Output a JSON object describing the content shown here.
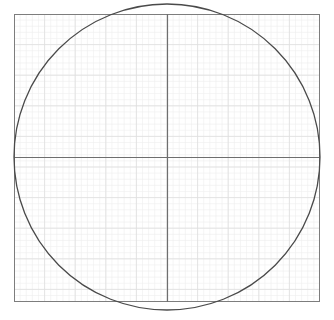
{
  "canvas": {
    "width": 334,
    "height": 320,
    "background": "#ffffff"
  },
  "chart_data": {
    "type": "scatter",
    "title": "",
    "subtitle": "",
    "xlabel": "",
    "ylabel": "",
    "grid": true,
    "legend_position": "none",
    "plot_frame": {
      "left": 14,
      "top": 14,
      "right": 320,
      "bottom": 302,
      "width": 306,
      "height": 288,
      "border_color": "#7d7d7d",
      "border_width": 1,
      "fill": "#ffffff"
    },
    "grid_lines": {
      "minor_spacing_px": 6.12,
      "major_spacing_px": 30.6,
      "minor_color": "#efefef",
      "major_color": "#dedede",
      "minor_width": 0.6,
      "major_width": 0.8,
      "minor_count_x": 50,
      "minor_count_y": 47,
      "major_count_x": 10,
      "major_count_y": 9
    },
    "axes": {
      "x_axis": {
        "orientation": "horizontal",
        "position_px": 157,
        "from_px": 14,
        "to_px": 320,
        "color": "#6e6e6e",
        "width": 1.2
      },
      "y_axis": {
        "orientation": "vertical",
        "position_px": 167,
        "from_px": 14,
        "to_px": 302,
        "color": "#6e6e6e",
        "width": 1.2
      },
      "xlim": [
        -1.0,
        1.0
      ],
      "ylim": [
        -0.94,
        0.94
      ]
    },
    "series": [
      {
        "name": "circle",
        "shape": "circle",
        "center_x_px": 167,
        "center_y_px": 157,
        "radius_px": 153,
        "center": [
          0,
          0
        ],
        "radius": 1.0,
        "stroke": "#4a4a4a",
        "stroke_width": 1.3,
        "fill": "none",
        "equation": "x^2 + y^2 = 1"
      }
    ],
    "annotations": [],
    "tick_labels": {
      "x": [],
      "y": []
    }
  }
}
